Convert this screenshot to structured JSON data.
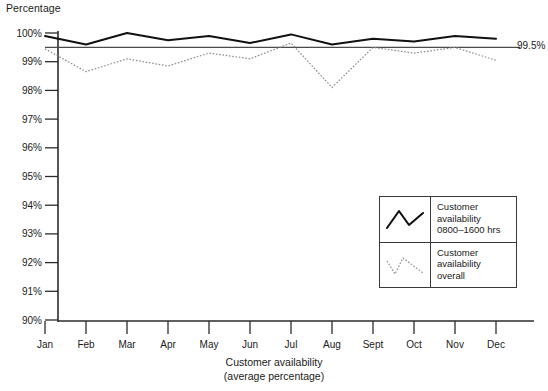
{
  "chart_data": {
    "type": "line",
    "title": "",
    "ylabel": "Percentage",
    "xlabel": "Customer availability",
    "xlabel_sub": "(average percentage)",
    "categories": [
      "Jan",
      "Feb",
      "Mar",
      "Apr",
      "May",
      "Jun",
      "Jul",
      "Aug",
      "Sept",
      "Oct",
      "Nov",
      "Dec"
    ],
    "ylim": [
      90,
      100
    ],
    "ytick_labels": [
      "100%",
      "99%",
      "98%",
      "97%",
      "96%",
      "95%",
      "94%",
      "93%",
      "92%",
      "91%",
      "90%"
    ],
    "ytick_values": [
      100,
      99,
      98,
      97,
      96,
      95,
      94,
      93,
      92,
      91,
      90
    ],
    "grid": false,
    "legend_position": "inside-bottom-right",
    "reference_line": {
      "value": 99.5,
      "label": "99.5%",
      "style": "solid-thin"
    },
    "series": [
      {
        "name": "Customer availability 0800-1600 hrs",
        "style": "solid",
        "color": "#111111",
        "values": [
          99.9,
          99.6,
          100.0,
          99.75,
          99.9,
          99.65,
          99.95,
          99.6,
          99.8,
          99.7,
          99.9,
          99.8
        ]
      },
      {
        "name": "Customer availability overall",
        "style": "dotted",
        "color": "#8d8d8d",
        "values": [
          99.45,
          98.65,
          99.1,
          98.85,
          99.3,
          99.1,
          99.65,
          98.1,
          99.5,
          99.3,
          99.5,
          99.05
        ]
      }
    ]
  },
  "legend": {
    "entries": [
      {
        "line1": "Customer",
        "line2": "availability",
        "line3": "0800–1600 hrs",
        "swatch": "solid-peak-icon"
      },
      {
        "line1": "Customer",
        "line2": "availability",
        "line3": "overall",
        "swatch": "dotted-peak-icon"
      }
    ]
  }
}
